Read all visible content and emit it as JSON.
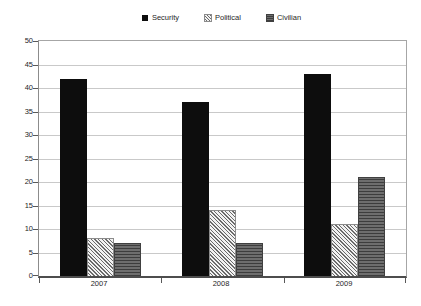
{
  "chart_data": {
    "type": "bar",
    "title": "",
    "xlabel": "",
    "ylabel": "",
    "categories": [
      "2007",
      "2008",
      "2009"
    ],
    "series": [
      {
        "name": "Security",
        "values": [
          42,
          37,
          43
        ],
        "style": "solid-black"
      },
      {
        "name": "Political",
        "values": [
          8,
          14,
          11
        ],
        "style": "diagonal-hatch"
      },
      {
        "name": "Civilian",
        "values": [
          7,
          7,
          21
        ],
        "style": "horizontal-stripe-gray"
      }
    ],
    "ylim": [
      0,
      50
    ],
    "ytick_step": 5,
    "grid": true,
    "legend_position": "top-center"
  },
  "colors": {
    "security_fill": "#0d0d0d",
    "political_hatch_line": "#6b6b6b",
    "civilian_base": "#595959",
    "gridline": "#c9c9c9",
    "axis": "#595959",
    "text": "#262626",
    "background": "#ffffff"
  }
}
